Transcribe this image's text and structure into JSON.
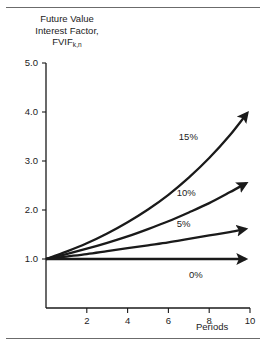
{
  "figure": {
    "title_lines": [
      "Future Value",
      "Interest Factor,",
      "FVIF"
    ],
    "title_subscript": "k,n",
    "rule_color": "#6b6b6b",
    "ink_color": "#1a1a1a"
  },
  "chart_data": {
    "type": "line",
    "xlabel": "Periods",
    "ylabel": "Future Value Interest Factor, FVIF k,n",
    "xlim": [
      0,
      10
    ],
    "ylim": [
      0,
      5.0
    ],
    "xticks": [
      2,
      4,
      6,
      8,
      10
    ],
    "xtick_labels": [
      "2",
      "4",
      "6",
      "8",
      "10"
    ],
    "yticks": [
      1.0,
      2.0,
      3.0,
      4.0,
      5.0
    ],
    "ytick_labels": [
      "1.0",
      "2.0",
      "3.0",
      "4.0",
      "5.0"
    ],
    "grid": false,
    "legend": "inline-end-labels",
    "x": [
      0,
      1,
      2,
      3,
      4,
      5,
      6,
      7,
      8,
      9,
      10
    ],
    "series": [
      {
        "name": "15%",
        "label": "15%",
        "values": [
          1.0,
          1.15,
          1.32,
          1.52,
          1.75,
          2.01,
          2.31,
          2.66,
          3.06,
          3.52,
          4.05
        ]
      },
      {
        "name": "10%",
        "label": "10%",
        "values": [
          1.0,
          1.1,
          1.21,
          1.33,
          1.46,
          1.61,
          1.77,
          1.95,
          2.14,
          2.36,
          2.59
        ]
      },
      {
        "name": "5%",
        "label": "5%",
        "values": [
          1.0,
          1.05,
          1.1,
          1.16,
          1.22,
          1.28,
          1.34,
          1.41,
          1.48,
          1.55,
          1.63
        ]
      },
      {
        "name": "0%",
        "label": "0%",
        "values": [
          1.0,
          1.0,
          1.0,
          1.0,
          1.0,
          1.0,
          1.0,
          1.0,
          1.0,
          1.0,
          1.0
        ]
      }
    ],
    "series_label_positions": [
      {
        "name": "15%",
        "x": 7.1,
        "y": 3.48
      },
      {
        "name": "10%",
        "x": 7.0,
        "y": 2.34
      },
      {
        "name": "5%",
        "x": 7.0,
        "y": 1.72
      },
      {
        "name": "0%",
        "x": 7.6,
        "y": 0.68
      }
    ]
  }
}
